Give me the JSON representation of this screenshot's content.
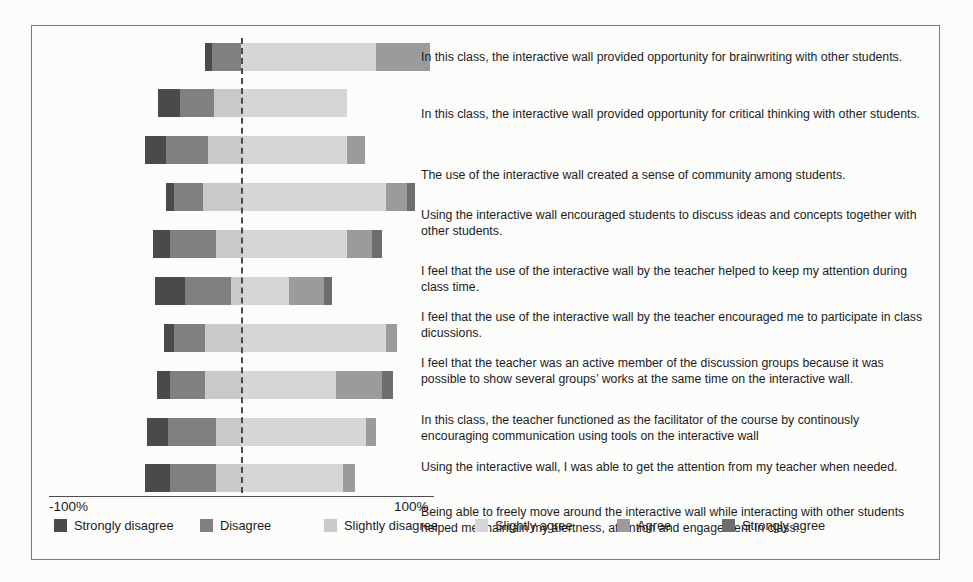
{
  "chart_data": {
    "type": "bar",
    "title": "",
    "subtitle": "",
    "xlabel": "",
    "ylabel": "",
    "orientation": "horizontal",
    "stacking": "diverging-likert",
    "grid": false,
    "legend_position": "bottom",
    "xlim": [
      -100,
      100
    ],
    "xticks": [
      -100,
      100
    ],
    "xticklabels": [
      "-100%",
      "100%"
    ],
    "zero_reference_line": true,
    "categories": [
      "In this class, the interactive wall provided opportunity for brainwriting with other students.",
      "In this class, the interactive wall provided opportunity for critical thinking with other students.",
      "The use of the interactive wall created a sense of community among students.",
      "Using the interactive wall encouraged students to discuss ideas and concepts together with other students.",
      "I feel that the use of the interactive wall by the teacher helped to keep my attention during class time.",
      "I feel that the use of the interactive wall by the teacher encouraged me to participate in class dicussions.",
      "I feel that the teacher was an active member of the discussion groups because it was possible to show several groups' works at the same time on the interactive wall.",
      "In this class, the teacher functioned as the facilitator of the course by continously encouraging communication using tools on the interactive wall",
      "Using the interactive wall, I was able to get the attention from my teacher when needed.",
      "Being able to freely move around the interactive wall while interacting with other students helped me maintain my alertness, attention and engagement in class."
    ],
    "series": [
      {
        "name": "Strongly disagree",
        "color": "#4a4a4a",
        "values": [
          4,
          11,
          11,
          4,
          9,
          16,
          5,
          7,
          11,
          13
        ]
      },
      {
        "name": "Disagree",
        "color": "#808080",
        "values": [
          15,
          18,
          22,
          15,
          24,
          24,
          16,
          18,
          25,
          24
        ]
      },
      {
        "name": "Slightly disagree",
        "color": "#c9c9c9",
        "values": [
          0,
          14,
          17,
          20,
          13,
          5,
          19,
          19,
          13,
          13
        ]
      },
      {
        "name": "Slightly agree",
        "color": "#d6d6d6",
        "values": [
          70,
          55,
          55,
          75,
          55,
          25,
          75,
          49,
          65,
          53
        ]
      },
      {
        "name": "Agree",
        "color": "#9b9b9b",
        "values": [
          28,
          0,
          9,
          11,
          13,
          18,
          6,
          24,
          5,
          6
        ]
      },
      {
        "name": "Strongly agree",
        "color": "#6e6e6e",
        "values": [
          0,
          0,
          0,
          4,
          5,
          4,
          0,
          6,
          0,
          0
        ]
      }
    ],
    "bars": [
      {
        "row": 1,
        "neg_total": 19,
        "pos_total": 98,
        "segments": [
          {
            "name": "Strongly disagree",
            "value": 4
          },
          {
            "name": "Disagree",
            "value": 15
          },
          {
            "name": "Slightly disagree",
            "value": 0
          },
          {
            "name": "Slightly agree",
            "value": 70
          },
          {
            "name": "Agree",
            "value": 28
          },
          {
            "name": "Strongly agree",
            "value": 0
          }
        ]
      },
      {
        "row": 2,
        "neg_total": 43,
        "pos_total": 55,
        "segments": [
          {
            "name": "Strongly disagree",
            "value": 11
          },
          {
            "name": "Disagree",
            "value": 18
          },
          {
            "name": "Slightly disagree",
            "value": 14
          },
          {
            "name": "Slightly agree",
            "value": 55
          },
          {
            "name": "Agree",
            "value": 0
          },
          {
            "name": "Strongly agree",
            "value": 0
          }
        ]
      },
      {
        "row": 3,
        "neg_total": 50,
        "pos_total": 64,
        "segments": [
          {
            "name": "Strongly disagree",
            "value": 11
          },
          {
            "name": "Disagree",
            "value": 22
          },
          {
            "name": "Slightly disagree",
            "value": 17
          },
          {
            "name": "Slightly agree",
            "value": 55
          },
          {
            "name": "Agree",
            "value": 9
          },
          {
            "name": "Strongly agree",
            "value": 0
          }
        ]
      },
      {
        "row": 4,
        "neg_total": 39,
        "pos_total": 90,
        "segments": [
          {
            "name": "Strongly disagree",
            "value": 4
          },
          {
            "name": "Disagree",
            "value": 15
          },
          {
            "name": "Slightly disagree",
            "value": 20
          },
          {
            "name": "Slightly agree",
            "value": 75
          },
          {
            "name": "Agree",
            "value": 11
          },
          {
            "name": "Strongly agree",
            "value": 4
          }
        ]
      },
      {
        "row": 5,
        "neg_total": 46,
        "pos_total": 73,
        "segments": [
          {
            "name": "Strongly disagree",
            "value": 9
          },
          {
            "name": "Disagree",
            "value": 24
          },
          {
            "name": "Slightly disagree",
            "value": 13
          },
          {
            "name": "Slightly agree",
            "value": 55
          },
          {
            "name": "Agree",
            "value": 13
          },
          {
            "name": "Strongly agree",
            "value": 5
          }
        ]
      },
      {
        "row": 6,
        "neg_total": 45,
        "pos_total": 47,
        "segments": [
          {
            "name": "Strongly disagree",
            "value": 16
          },
          {
            "name": "Disagree",
            "value": 24
          },
          {
            "name": "Slightly disagree",
            "value": 5
          },
          {
            "name": "Slightly agree",
            "value": 25
          },
          {
            "name": "Agree",
            "value": 18
          },
          {
            "name": "Strongly agree",
            "value": 4
          }
        ]
      },
      {
        "row": 7,
        "neg_total": 40,
        "pos_total": 81,
        "segments": [
          {
            "name": "Strongly disagree",
            "value": 5
          },
          {
            "name": "Disagree",
            "value": 16
          },
          {
            "name": "Slightly disagree",
            "value": 19
          },
          {
            "name": "Slightly agree",
            "value": 75
          },
          {
            "name": "Agree",
            "value": 6
          },
          {
            "name": "Strongly agree",
            "value": 0
          }
        ]
      },
      {
        "row": 8,
        "neg_total": 44,
        "pos_total": 79,
        "segments": [
          {
            "name": "Strongly disagree",
            "value": 7
          },
          {
            "name": "Disagree",
            "value": 18
          },
          {
            "name": "Slightly disagree",
            "value": 19
          },
          {
            "name": "Slightly agree",
            "value": 49
          },
          {
            "name": "Agree",
            "value": 24
          },
          {
            "name": "Strongly agree",
            "value": 6
          }
        ]
      },
      {
        "row": 9,
        "neg_total": 49,
        "pos_total": 70,
        "segments": [
          {
            "name": "Strongly disagree",
            "value": 11
          },
          {
            "name": "Disagree",
            "value": 25
          },
          {
            "name": "Slightly disagree",
            "value": 13
          },
          {
            "name": "Slightly agree",
            "value": 65
          },
          {
            "name": "Agree",
            "value": 5
          },
          {
            "name": "Strongly agree",
            "value": 0
          }
        ]
      },
      {
        "row": 10,
        "neg_total": 50,
        "pos_total": 59,
        "segments": [
          {
            "name": "Strongly disagree",
            "value": 13
          },
          {
            "name": "Disagree",
            "value": 24
          },
          {
            "name": "Slightly disagree",
            "value": 13
          },
          {
            "name": "Slightly agree",
            "value": 53
          },
          {
            "name": "Agree",
            "value": 6
          },
          {
            "name": "Strongly agree",
            "value": 0
          }
        ]
      }
    ]
  },
  "axis": {
    "left_label": "-100%",
    "right_label": "100%"
  },
  "legend": {
    "items": [
      {
        "label": "Strongly disagree",
        "color": "#4a4a4a"
      },
      {
        "label": "Disagree",
        "color": "#808080"
      },
      {
        "label": "Slightly disagree",
        "color": "#c9c9c9"
      },
      {
        "label": "Slightly agree",
        "color": "#d6d6d6"
      },
      {
        "label": "Agree",
        "color": "#9b9b9b"
      },
      {
        "label": "Strongly agree",
        "color": "#6e6e6e"
      }
    ]
  },
  "statements": [
    "In this class, the interactive wall provided opportunity for brainwriting with other students.",
    "In this class, the interactive wall provided opportunity for critical thinking with other students.",
    "The use of the interactive wall created a sense of community among students.",
    "Using the interactive wall encouraged students to discuss ideas and concepts together with other students.",
    "I feel that the use of the interactive wall by the teacher helped to keep my attention during class time.",
    "I feel that the use of the interactive wall by the teacher encouraged me to participate in class dicussions.",
    "I feel that the teacher was an active member of the discussion groups because it was possible to show several groups’ works at the same time on the interactive wall.",
    "In this class, the teacher functioned as the facilitator of the course by continously encouraging communication using tools on the interactive wall",
    "Using the interactive wall, I was able to get the attention from my teacher when needed.",
    "Being able to freely move around the interactive wall while interacting with other students helped me maintain my alertness, attention and engagement in class."
  ]
}
